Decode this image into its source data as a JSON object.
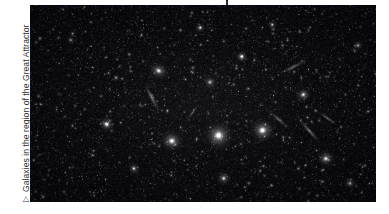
{
  "page": {
    "background_color": "#ffffff",
    "width": 389,
    "height": 214
  },
  "top_tick": {
    "name": "page-tick-mark",
    "color": "#2b2b2b",
    "x": 226,
    "height": 7
  },
  "caption": {
    "marker_glyph": "▷",
    "marker_name": "triangle-right-icon",
    "text": "Galaxies in the region of the Great Attractor",
    "color": "#2e2e2e",
    "rotation_deg": -90
  },
  "figure": {
    "name": "great-attractor-sky-image",
    "alt": "Galaxies in the region of the Great Attractor",
    "background_color": "#000000",
    "x": 30,
    "y": 5,
    "width": 346,
    "height": 197
  },
  "sky": {
    "seed": 20240517,
    "background_color": "#040407",
    "faint_star_count": 5200,
    "mid_star_count": 520,
    "star_color": "#ffffff",
    "bright_galaxies": [
      {
        "name": "elliptical-cluster-core",
        "x": 0.545,
        "y": 0.662,
        "r": 17.0,
        "i": 1.0,
        "ell": 1.0,
        "ang": 0
      },
      {
        "name": "elliptical-cluster-west",
        "x": 0.41,
        "y": 0.69,
        "r": 14.0,
        "i": 0.86,
        "ell": 1.1,
        "ang": 10
      },
      {
        "name": "elliptical-cluster-east",
        "x": 0.672,
        "y": 0.636,
        "r": 15.0,
        "i": 0.92,
        "ell": 1.05,
        "ang": -5
      },
      {
        "name": "diffuse-galaxy-upper-left",
        "x": 0.372,
        "y": 0.334,
        "r": 13.0,
        "i": 0.7,
        "ell": 1.25,
        "ang": 25
      },
      {
        "name": "diffuse-galaxy-upper-mid",
        "x": 0.52,
        "y": 0.392,
        "r": 8.5,
        "i": 0.6,
        "ell": 1.0,
        "ang": 0
      },
      {
        "name": "bright-star-upper-right",
        "x": 0.612,
        "y": 0.262,
        "r": 7.0,
        "i": 0.95,
        "ell": 1.0,
        "ang": 0
      },
      {
        "name": "bright-star-left",
        "x": 0.222,
        "y": 0.606,
        "r": 9.0,
        "i": 0.9,
        "ell": 1.0,
        "ang": 0
      },
      {
        "name": "galaxy-left-lower",
        "x": 0.3,
        "y": 0.83,
        "r": 7.5,
        "i": 0.62,
        "ell": 1.0,
        "ang": 0
      },
      {
        "name": "galaxy-right-mid",
        "x": 0.79,
        "y": 0.455,
        "r": 10.0,
        "i": 0.72,
        "ell": 1.15,
        "ang": -20
      },
      {
        "name": "galaxy-right-lower",
        "x": 0.855,
        "y": 0.78,
        "r": 11.0,
        "i": 0.74,
        "ell": 1.05,
        "ang": 0
      },
      {
        "name": "galaxy-bottom-mid",
        "x": 0.56,
        "y": 0.88,
        "r": 9.0,
        "i": 0.66,
        "ell": 1.0,
        "ang": 0
      },
      {
        "name": "galaxy-bottom-right",
        "x": 0.925,
        "y": 0.905,
        "r": 8.0,
        "i": 0.58,
        "ell": 1.0,
        "ang": 0
      },
      {
        "name": "galaxy-top-mid",
        "x": 0.492,
        "y": 0.115,
        "r": 6.5,
        "i": 0.7,
        "ell": 1.0,
        "ang": 0
      },
      {
        "name": "galaxy-top-right",
        "x": 0.7,
        "y": 0.1,
        "r": 6.0,
        "i": 0.64,
        "ell": 1.0,
        "ang": 0
      },
      {
        "name": "galaxy-far-right-top",
        "x": 0.948,
        "y": 0.205,
        "r": 6.5,
        "i": 0.6,
        "ell": 1.0,
        "ang": 0
      },
      {
        "name": "galaxy-left-top",
        "x": 0.118,
        "y": 0.178,
        "r": 5.5,
        "i": 0.55,
        "ell": 1.0,
        "ang": 0
      }
    ],
    "edge_on_galaxies": [
      {
        "name": "edge-on-spiral-upper-left",
        "x": 0.352,
        "y": 0.47,
        "len": 19,
        "wid": 3.2,
        "ang": 62,
        "i": 0.55
      },
      {
        "name": "edge-on-spiral-right-upper",
        "x": 0.76,
        "y": 0.315,
        "len": 17,
        "wid": 3.0,
        "ang": -28,
        "i": 0.5
      },
      {
        "name": "edge-on-spiral-right-mid",
        "x": 0.718,
        "y": 0.58,
        "len": 16,
        "wid": 2.8,
        "ang": 40,
        "i": 0.48
      },
      {
        "name": "edge-on-spiral-right-low",
        "x": 0.808,
        "y": 0.64,
        "len": 20,
        "wid": 3.0,
        "ang": 48,
        "i": 0.52
      },
      {
        "name": "edge-on-spiral-bottom",
        "x": 0.86,
        "y": 0.575,
        "len": 14,
        "wid": 2.6,
        "ang": 35,
        "i": 0.44
      },
      {
        "name": "edge-on-spiral-center",
        "x": 0.47,
        "y": 0.545,
        "len": 12,
        "wid": 2.4,
        "ang": -55,
        "i": 0.4
      }
    ]
  }
}
